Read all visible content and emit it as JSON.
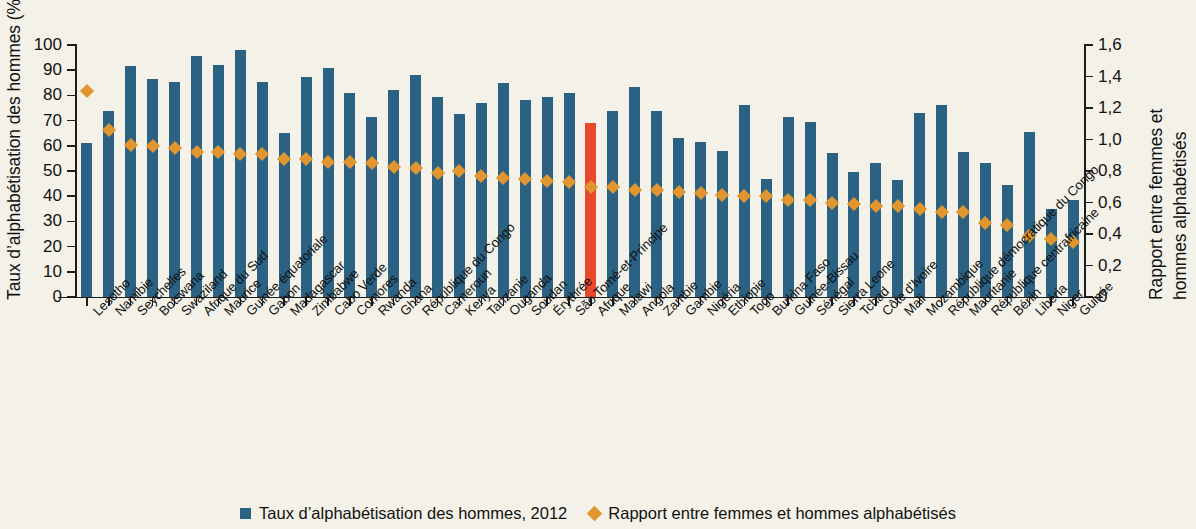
{
  "chart_data": {
    "type": "bar",
    "title": "",
    "ylabel": "Taux d’alphabétisation des hommes (%)",
    "ylabel_right_line1": "Rapport entre femmes et",
    "ylabel_right_line2": "hommes alphabétisés",
    "xlabel": "",
    "ylim": [
      0,
      100
    ],
    "ylim_right": [
      0,
      1.6
    ],
    "grid": false,
    "legend_position": "bottom",
    "left_ticks": [
      "0",
      "10",
      "20",
      "30",
      "40",
      "50",
      "60",
      "70",
      "80",
      "90",
      "100"
    ],
    "right_ticks": [
      "0",
      "0,2",
      "0,4",
      "0,6",
      "0,8",
      "1,0",
      "1,2",
      "1,4",
      "1,6"
    ],
    "highlight_category": "Afrique",
    "colors": {
      "bar": "#2b6183",
      "bar_highlight": "#e8482b",
      "diamond": "#e0952f",
      "background": "#f4f1e8",
      "axis": "#1d1d1b"
    },
    "categories": [
      "Lesotho",
      "Namibie",
      "Seychelles",
      "Botswana",
      "Swaziland",
      "Afrique du Sud",
      "Maurice",
      "Guinée équatoriale",
      "Gabon",
      "Madagascar",
      "Zimbabwe",
      "Cabo Verde",
      "Comores",
      "Rwanda",
      "Ghana",
      "République du Congo",
      "Cameroun",
      "Kenya",
      "Tanzanie",
      "Ouganda",
      "Soudan",
      "Érythrée",
      "São Tomé-et-Príncipe",
      "Afrique",
      "Malawi",
      "Angola",
      "Zambie",
      "Gambie",
      "Nigéria",
      "Ethiopie",
      "Togo",
      "Burkina Faso",
      "Guinée-Bissau",
      "Sénégal",
      "Sierra Leone",
      "Tchad",
      "Côte d’Ivoire",
      "Mali",
      "Mozambique",
      "République démocratique du Congo",
      "Mauritanie",
      "République centrafricaine",
      "Bénin",
      "Libéria",
      "Niger",
      "Guinée"
    ],
    "series": [
      {
        "name": "Taux d’alphabétisation des hommes, 2012",
        "type": "bar",
        "axis": "left",
        "values": [
          61,
          74,
          91.5,
          86.5,
          85.5,
          95.5,
          92,
          98,
          85.5,
          65,
          87.5,
          91,
          81,
          71.5,
          82,
          88,
          79.5,
          72.5,
          77,
          85,
          78,
          79.5,
          81,
          69,
          74,
          83.5,
          74,
          63,
          61.5,
          58,
          76,
          47,
          71.5,
          69.5,
          57,
          49.5,
          53,
          46.5,
          73,
          76,
          57.5,
          53,
          44.5,
          65.5,
          35,
          38.5
        ]
      },
      {
        "name": "Rapport entre femmes et hommes alphabétisés",
        "type": "scatter",
        "axis": "right",
        "values": [
          1.34,
          1.09,
          1.0,
          0.99,
          0.98,
          0.95,
          0.95,
          0.94,
          0.94,
          0.91,
          0.91,
          0.89,
          0.89,
          0.88,
          0.86,
          0.85,
          0.82,
          0.83,
          0.8,
          0.79,
          0.78,
          0.77,
          0.76,
          0.73,
          0.73,
          0.71,
          0.71,
          0.7,
          0.69,
          0.68,
          0.67,
          0.67,
          0.65,
          0.65,
          0.63,
          0.62,
          0.61,
          0.61,
          0.59,
          0.57,
          0.57,
          0.5,
          0.49,
          0.42,
          0.4,
          0.38
        ]
      }
    ]
  },
  "legend": {
    "items": [
      {
        "label": "Taux d’alphabétisation des hommes, 2012",
        "marker": "square-icon"
      },
      {
        "label": "Rapport entre femmes et hommes alphabétisés",
        "marker": "diamond-icon"
      }
    ]
  }
}
